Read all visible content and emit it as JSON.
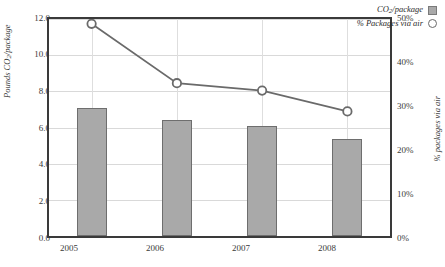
{
  "chart_data": {
    "type": "bar",
    "title": "",
    "subtitle": "",
    "xlabel": "",
    "ylabel": "Pounds CO2/package",
    "ylabel_parts": {
      "pre": "Pounds CO",
      "sub": "2",
      "post": "/package"
    },
    "y2label": "% packages via air",
    "categories": [
      "2005",
      "2006",
      "2007",
      "2008"
    ],
    "ylim": [
      0,
      12
    ],
    "yticks": [
      "0.0",
      "2.0",
      "4.0",
      "6.0",
      "8.0",
      "10.0",
      "12.0"
    ],
    "ytick_values": [
      0,
      2,
      4,
      6,
      8,
      10,
      12
    ],
    "y2lim": [
      0,
      50
    ],
    "y2ticks": [
      "0%",
      "10%",
      "20%",
      "30%",
      "40%",
      "50%"
    ],
    "y2tick_values": [
      0,
      10,
      20,
      30,
      40,
      50
    ],
    "grid": true,
    "legend_position": "top-right",
    "series": [
      {
        "name": "CO2/package",
        "name_parts": {
          "pre": "CO",
          "sub": "2",
          "post": "/package"
        },
        "type": "bar",
        "axis": "left",
        "color": "#a9a9a9",
        "edge_color": "#6e6e6e",
        "values": [
          7.1,
          6.4,
          6.1,
          5.35
        ]
      },
      {
        "name": "% Packages via air",
        "type": "line",
        "axis": "right",
        "color": "#6a6a6a",
        "marker": "open-circle",
        "values": [
          48.9,
          35.2,
          33.5,
          28.7
        ]
      }
    ]
  },
  "legend": {
    "items": [
      {
        "label_pre": "CO",
        "label_sub": "2",
        "label_post": "/package",
        "marker": "square-swatch"
      },
      {
        "label": "% Packages via air",
        "marker": "circle-marker"
      }
    ]
  },
  "colors": {
    "bar_fill": "#a9a9a9",
    "bar_edge": "#6e6e6e",
    "line": "#6a6a6a",
    "frame": "#3a3a3a",
    "grid": "#d9d9d9",
    "text": "#3a3a3a",
    "background": "#ffffff"
  }
}
